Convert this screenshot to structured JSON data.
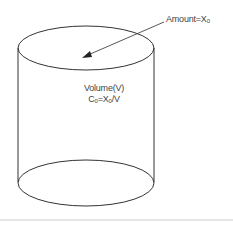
{
  "diagram": {
    "type": "cylinder-compartment",
    "amount_label": "Amount=X",
    "amount_subscript": "0",
    "volume_label": "Volume(V)",
    "concentration_label_prefix": "C",
    "concentration_subscript": "0",
    "concentration_label_mid": "=X",
    "concentration_mid_subscript": "0",
    "concentration_label_suffix": "/V",
    "colors": {
      "stroke": "#333333",
      "text": "#444444",
      "divider": "#cccccc"
    }
  }
}
